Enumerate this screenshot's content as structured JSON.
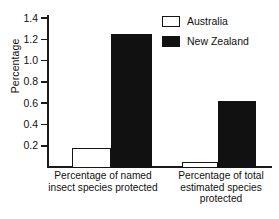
{
  "chart_data": {
    "type": "bar",
    "title": "",
    "subtitle": "",
    "xlabel": "",
    "ylabel": "Percentage",
    "ylim": [
      0,
      1.5
    ],
    "yticks": [
      0.2,
      0.4,
      0.6,
      0.8,
      1.0,
      1.2,
      1.4
    ],
    "ytick_labels": [
      "0.2",
      "0.4",
      "0.6",
      "0.8",
      "1.0",
      "1.2",
      "1.4"
    ],
    "grid": false,
    "legend_position": "top-right",
    "categories": [
      "Percentage of named insect species protected",
      "Percentage of total estimated species protected"
    ],
    "series": [
      {
        "name": "Australia",
        "color": "#ffffff",
        "edge": "#141414",
        "values": [
          0.19,
          0.06
        ]
      },
      {
        "name": "New Zealand",
        "color": "#111111",
        "edge": "#111111",
        "values": [
          1.26,
          0.63
        ]
      }
    ]
  },
  "axis": {
    "y_title": "Percentage",
    "ticks": [
      {
        "value": 1.4,
        "label": "1.4"
      },
      {
        "value": 1.2,
        "label": "1.2"
      },
      {
        "value": 1.0,
        "label": "1.0"
      },
      {
        "value": 0.8,
        "label": "0.8"
      },
      {
        "value": 0.6,
        "label": "0.6"
      },
      {
        "value": 0.4,
        "label": "0.4"
      },
      {
        "value": 0.2,
        "label": "0.2"
      }
    ]
  },
  "legend": {
    "items": [
      {
        "label": "Australia",
        "swatch": "white-square-outline"
      },
      {
        "label": "New Zealand",
        "swatch": "black-filled-square"
      }
    ]
  },
  "category_labels": [
    "Percentage of named insect species protected",
    "Percentage of total estimated species protected"
  ]
}
